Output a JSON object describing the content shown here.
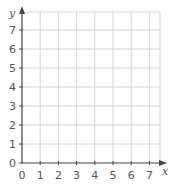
{
  "chart_data": {
    "type": "scatter",
    "title": "",
    "xlabel": "x",
    "ylabel": "y",
    "xlim": [
      0,
      7.5
    ],
    "ylim": [
      0,
      7.5
    ],
    "x_ticks": [
      "0",
      "1",
      "2",
      "3",
      "4",
      "5",
      "6",
      "7"
    ],
    "y_ticks": [
      "0",
      "1",
      "2",
      "3",
      "4",
      "5",
      "6",
      "7"
    ],
    "grid": true,
    "series": [],
    "legend": null
  },
  "colors": {
    "axis": "#444444",
    "grid": "#d4d4d4",
    "label": "#555555"
  }
}
